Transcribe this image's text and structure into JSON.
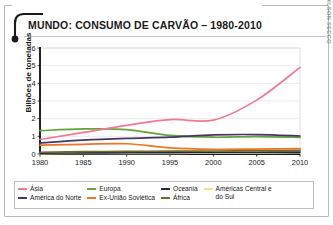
{
  "title": "MUNDO: CONSUMO DE CARVÃO – 1980-2010",
  "credit": "ADILSON SECCO",
  "axis": {
    "ylabel": "Bilhões de toneladas",
    "yticks": [
      "0",
      "1",
      "2",
      "3",
      "4",
      "5",
      "6"
    ],
    "xticks": [
      "1980",
      "1985",
      "1990",
      "1995",
      "2000",
      "2005",
      "2010"
    ]
  },
  "legend": {
    "columns": [
      {
        "items": [
          {
            "label": "Ásia",
            "color": "#ee7b96",
            "wrap": false
          },
          {
            "label": "América do Norte",
            "color": "#453466",
            "wrap": false
          }
        ]
      },
      {
        "items": [
          {
            "label": "Europa",
            "color": "#62a33a",
            "wrap": false
          },
          {
            "label": "Ex-União Soviética",
            "color": "#ed7524",
            "wrap": false
          }
        ]
      },
      {
        "items": [
          {
            "label": "Oceania",
            "color": "#1d2a4e",
            "wrap": false
          },
          {
            "label": "África",
            "color": "#6e6a2a",
            "wrap": false
          }
        ]
      },
      {
        "items": [
          {
            "label": "Américas Central e do Sul",
            "color": "#f2e08c",
            "wrap": true
          }
        ]
      }
    ]
  },
  "chart_data": {
    "type": "line",
    "title": "MUNDO: CONSUMO DE CARVÃO – 1980-2010",
    "xlabel": "",
    "ylabel": "Bilhões de toneladas",
    "xlim": [
      1980,
      2010
    ],
    "ylim": [
      0,
      6
    ],
    "grid": true,
    "legend_position": "bottom",
    "x": [
      1980,
      1985,
      1990,
      1995,
      2000,
      2005,
      2010
    ],
    "series": [
      {
        "name": "Ásia",
        "color": "#ee7b96",
        "values": [
          0.82,
          1.22,
          1.62,
          1.95,
          1.92,
          3.05,
          4.9
        ]
      },
      {
        "name": "América do Norte",
        "color": "#453466",
        "values": [
          0.62,
          0.78,
          0.88,
          0.95,
          1.08,
          1.1,
          1.02
        ]
      },
      {
        "name": "Europa",
        "color": "#62a33a",
        "values": [
          1.32,
          1.42,
          1.38,
          1.05,
          0.95,
          0.98,
          0.94
        ]
      },
      {
        "name": "Ex-União Soviética",
        "color": "#ed7524",
        "values": [
          0.5,
          0.55,
          0.58,
          0.35,
          0.27,
          0.28,
          0.3
        ]
      },
      {
        "name": "África",
        "color": "#6e6a2a",
        "values": [
          0.1,
          0.13,
          0.15,
          0.16,
          0.17,
          0.19,
          0.2
        ]
      },
      {
        "name": "Oceania",
        "color": "#1d2a4e",
        "values": [
          0.05,
          0.06,
          0.07,
          0.08,
          0.09,
          0.1,
          0.11
        ]
      },
      {
        "name": "Américas Central e do Sul",
        "color": "#f2e08c",
        "values": [
          0.02,
          0.03,
          0.03,
          0.04,
          0.05,
          0.06,
          0.07
        ]
      }
    ]
  }
}
